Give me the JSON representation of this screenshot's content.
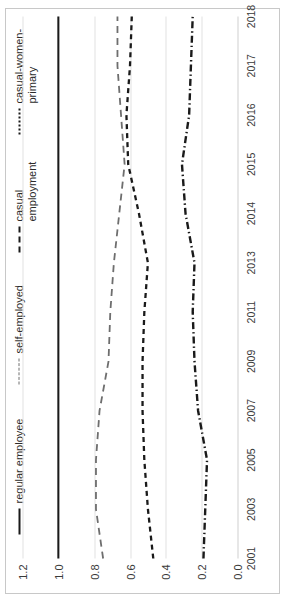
{
  "chart_data": {
    "type": "line",
    "title": "",
    "subtitle": "",
    "xlabel": "",
    "ylabel": "",
    "grid": true,
    "legend_position": "top",
    "orientation": "rotated-90-ccw",
    "categories": [
      "2001",
      "2003",
      "2005",
      "2007",
      "2009",
      "2011",
      "2013",
      "2014",
      "2015",
      "2016",
      "2017",
      "2018"
    ],
    "ylim": [
      0.0,
      1.2
    ],
    "yticks": [
      "0.0",
      "0.2",
      "0.4",
      "0.6",
      "0.8",
      "1.0",
      "1.2"
    ],
    "ytick_values": [
      0.0,
      0.2,
      0.4,
      0.6,
      0.8,
      1.0,
      1.2
    ],
    "series": [
      {
        "name": "regular employee",
        "style": "solid",
        "color": "#1a1a1a",
        "values": [
          1.0,
          1.0,
          1.0,
          1.0,
          1.0,
          1.0,
          1.0,
          1.0,
          1.0,
          1.0,
          1.0,
          1.0
        ]
      },
      {
        "name": "self-employed",
        "style": "dashed",
        "color": "#6e6e6e",
        "values": [
          0.75,
          0.79,
          0.79,
          0.77,
          0.72,
          0.71,
          0.69,
          0.66,
          0.63,
          0.65,
          0.67,
          0.67
        ]
      },
      {
        "name": "casual\nemployment",
        "style": "dashed-short",
        "color": "#1a1a1a",
        "values": [
          0.47,
          0.5,
          0.52,
          0.53,
          0.53,
          0.52,
          0.5,
          0.55,
          0.61,
          0.62,
          0.6,
          0.59
        ]
      },
      {
        "name": "casual-women-\nprimary",
        "style": "dash-dot",
        "color": "#1a1a1a",
        "values": [
          0.19,
          0.18,
          0.17,
          0.22,
          0.24,
          0.25,
          0.24,
          0.29,
          0.31,
          0.27,
          0.26,
          0.25
        ]
      }
    ]
  },
  "legend": {
    "entries": [
      {
        "label": "regular employee",
        "swatch": "solid"
      },
      {
        "label": "self-employed",
        "swatch": "dash"
      },
      {
        "label": "casual\nemployment",
        "swatch": "dash2"
      },
      {
        "label": "casual-women-\nprimary",
        "swatch": "dashdot"
      }
    ]
  },
  "colors": {
    "frame": "#c8c8c8",
    "gridline": "#e2e2e2",
    "text": "#3a3a3a",
    "series_solid": "#1a1a1a",
    "series_grey": "#6e6e6e"
  }
}
